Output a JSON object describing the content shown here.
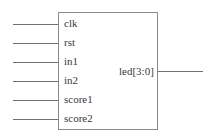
{
  "module": {
    "inputs": [
      {
        "name": "clk"
      },
      {
        "name": "rst"
      },
      {
        "name": "in1"
      },
      {
        "name": "in2"
      },
      {
        "name": "score1"
      },
      {
        "name": "score2"
      }
    ],
    "outputs": [
      {
        "name": "led[3:0]"
      }
    ]
  },
  "colors": {
    "line": "#6e6e6e",
    "box_border": "#8a8a8a",
    "text": "#3a3a3a",
    "background": "#ffffff"
  }
}
